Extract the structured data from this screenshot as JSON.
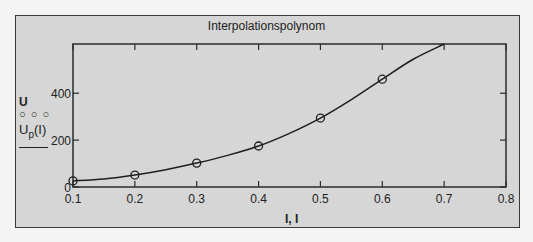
{
  "chart_data": {
    "type": "line",
    "title": "Interpolationspolynom",
    "xlabel": "I, I",
    "ylabel": "U / Up(I)",
    "xlim": [
      0.1,
      0.8
    ],
    "ylim": [
      0,
      610
    ],
    "xticks": [
      "0.1",
      "0.2",
      "0.3",
      "0.4",
      "0.5",
      "0.6",
      "0.7",
      "0.8"
    ],
    "yticks": [
      "0",
      "200",
      "400"
    ],
    "grid": false,
    "legend_position": "left",
    "series": [
      {
        "name": "U",
        "style": "markers (circles)",
        "x": [
          0.1,
          0.2,
          0.3,
          0.4,
          0.5,
          0.6
        ],
        "values": [
          26,
          51,
          102,
          175,
          294,
          460
        ]
      },
      {
        "name": "Up(I)",
        "style": "solid line",
        "x": [
          0.1,
          0.15,
          0.2,
          0.25,
          0.3,
          0.35,
          0.4,
          0.45,
          0.5,
          0.55,
          0.6,
          0.65,
          0.7
        ],
        "values": [
          26,
          34,
          51,
          74,
          102,
          135,
          175,
          229,
          294,
          373,
          460,
          545,
          610
        ]
      }
    ]
  },
  "legend": {
    "series1_label": "U",
    "series1_marker": "○ ○ ○",
    "series2_label": "U",
    "series2_sub": "p",
    "series2_arg": "(I)"
  },
  "xaxis_label": "I, I"
}
